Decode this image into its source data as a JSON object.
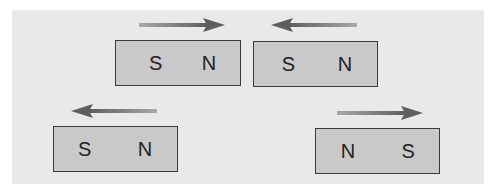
{
  "diagram": {
    "background_color": "#e9e9e9",
    "magnet_fill": "#c9c9c9",
    "magnet_border": "#3a3a3a",
    "arrow_color": "#6e6e6e",
    "magnets": [
      {
        "id": "top-left",
        "left_pole": "S",
        "right_pole": "N",
        "arrow_direction": "right"
      },
      {
        "id": "top-right",
        "left_pole": "S",
        "right_pole": "N",
        "arrow_direction": "left"
      },
      {
        "id": "bottom-left",
        "left_pole": "S",
        "right_pole": "N",
        "arrow_direction": "left"
      },
      {
        "id": "bottom-right",
        "left_pole": "N",
        "right_pole": "S",
        "arrow_direction": "right"
      }
    ]
  }
}
